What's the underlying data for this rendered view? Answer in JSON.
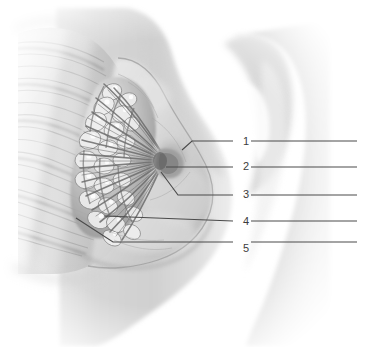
{
  "figure": {
    "caption_remnant": "",
    "background_color": "#ffffff",
    "line_color": "#4a4a4a",
    "number_color": "#3c3c3c",
    "width": 371,
    "height": 347
  },
  "illustration": {
    "type": "grayscale-medical-illustration",
    "view": "sagittal-lateral-section",
    "subject": "female-breast",
    "palette": {
      "skin_light": "#eeeeee",
      "skin_mid": "#d8d8d8",
      "skin_shadow": "#bdbdbd",
      "skin_deep_shadow": "#a6a6a6",
      "gland_light": "#f2f2f2",
      "gland_mid": "#b4b4b4",
      "gland_dark": "#7e7e7e",
      "duct": "#6e6e6e",
      "muscle_light": "#e4e4e4",
      "muscle_dark": "#a0a0a0",
      "outline": "#8c8c8c"
    },
    "structures": [
      "chest-wall-muscle",
      "ribs",
      "glandular-lobules",
      "lactiferous-ducts",
      "nipple",
      "areola",
      "adipose-tissue",
      "suspensory-ligaments",
      "breast-contour",
      "arm",
      "torso"
    ]
  },
  "labels": [
    {
      "id": 1,
      "number": "1",
      "answer_line": "",
      "number_x": 240,
      "number_y": 136,
      "line_points": "182,150 192,141 233,141",
      "rule_x1": 251,
      "rule_x2": 357,
      "rule_y": 141
    },
    {
      "id": 2,
      "number": "2",
      "answer_line": "",
      "number_x": 240,
      "number_y": 161,
      "line_points": "166,167 233,167",
      "rule_x1": 251,
      "rule_x2": 357,
      "rule_y": 167
    },
    {
      "id": 3,
      "number": "3",
      "answer_line": "",
      "number_x": 240,
      "number_y": 189,
      "line_points": "161,172 178,195 233,195",
      "rule_x1": 251,
      "rule_x2": 357,
      "rule_y": 195
    },
    {
      "id": 4,
      "number": "4",
      "answer_line": "",
      "number_x": 240,
      "number_y": 216,
      "line_points": "104,216 233,221",
      "rule_x1": 251,
      "rule_x2": 357,
      "rule_y": 221
    },
    {
      "id": 5,
      "number": "5",
      "answer_line": "",
      "number_x": 240,
      "number_y": 243,
      "line_points": "76,218 113,242 233,242",
      "rule_x1": 251,
      "rule_x2": 357,
      "rule_y": 242
    }
  ]
}
